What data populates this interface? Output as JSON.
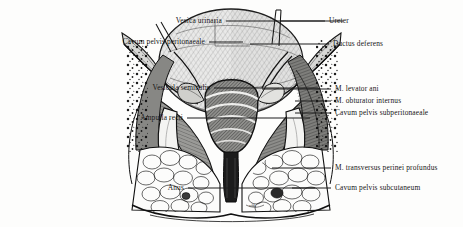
{
  "figure": {
    "style": "engraving",
    "ink_color": "#1a1a1a",
    "background_color": "#fdfdfc",
    "signature": "wbk"
  },
  "labels_left": [
    {
      "text": "Vesica urinaria",
      "x": 155,
      "y": 21,
      "leader_to": 243
    },
    {
      "text": "Cavum pelvis peritonaeale",
      "x": 113,
      "y": 42,
      "leader_to": 143
    },
    {
      "text": "Vesicula seminalis",
      "x": 143,
      "y": 88,
      "leader_to": 218
    },
    {
      "text": "Ampulla recti",
      "x": 116,
      "y": 118,
      "leader_to": 210
    },
    {
      "text": "Anus",
      "x": 115,
      "y": 188,
      "leader_to": 245
    }
  ],
  "labels_right": [
    {
      "text": "Ureter",
      "x": 328,
      "y": 21,
      "leader_from": 280
    },
    {
      "text": "Ductus deferens",
      "x": 332,
      "y": 44,
      "leader_from": 250
    },
    {
      "text": "M. levator ani",
      "x": 334,
      "y": 89,
      "leader_from": 262
    },
    {
      "text": "M. obturator internus",
      "x": 334,
      "y": 101,
      "leader_from": 295
    },
    {
      "text": "Cavum pelvis subperitonaeale",
      "x": 334,
      "y": 113,
      "leader_from": 295
    },
    {
      "text": "M. transversus perinei profundus",
      "x": 334,
      "y": 168,
      "leader_from": 272
    },
    {
      "text": "Cavum pelvis subcutaneum",
      "x": 334,
      "y": 188,
      "leader_from": 292
    }
  ],
  "structures": [
    {
      "name": "vesica-urinaria",
      "kind": "bladder-dome"
    },
    {
      "name": "ureter",
      "kind": "tube-pair"
    },
    {
      "name": "ductus-deferens",
      "kind": "duct"
    },
    {
      "name": "vesicula-seminalis",
      "kind": "gland"
    },
    {
      "name": "prostata",
      "kind": "gland"
    },
    {
      "name": "ampulla-recti",
      "kind": "rectum"
    },
    {
      "name": "anus",
      "kind": "canal"
    },
    {
      "name": "m-levator-ani",
      "kind": "muscle-sheet"
    },
    {
      "name": "m-obturator-internus",
      "kind": "muscle-sheet"
    },
    {
      "name": "m-transversus-perinei-profundus",
      "kind": "muscle-band"
    },
    {
      "name": "cavum-pelvis-peritonaeale",
      "kind": "space"
    },
    {
      "name": "cavum-pelvis-subperitonaeale",
      "kind": "space-fat"
    },
    {
      "name": "cavum-pelvis-subcutaneum",
      "kind": "space-fat"
    }
  ]
}
